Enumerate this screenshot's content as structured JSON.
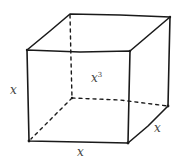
{
  "diagram": {
    "type": "cube",
    "labels": {
      "height": "x",
      "width": "x",
      "depth": "x",
      "volume_base": "x",
      "volume_exponent": "3"
    },
    "colors": {
      "stroke": "#1a1a1a",
      "label": "#444444",
      "background": "#ffffff"
    }
  }
}
